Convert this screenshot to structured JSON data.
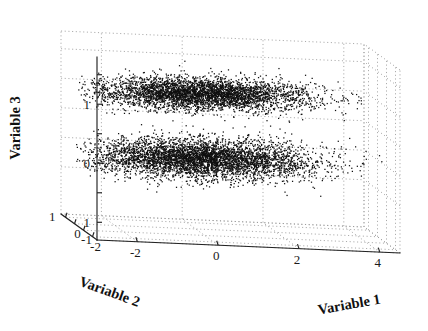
{
  "chart_data": {
    "type": "scatter",
    "dimensions": "3d",
    "title": "",
    "xlabel": "Variable 1",
    "ylabel": "Variable 2",
    "zlabel": "Variable 3",
    "xticks": [
      "-2",
      "0",
      "2",
      "4"
    ],
    "xtick_values": [
      -2,
      0,
      2,
      4
    ],
    "yticks": [
      "1",
      "0",
      "-1",
      "-2"
    ],
    "ytick_values": [
      1,
      0,
      -1,
      -2
    ],
    "zticks": [
      "1",
      "0",
      "1"
    ],
    "ztick_values": [
      1,
      0,
      -1
    ],
    "xlim": [
      -3,
      4.5
    ],
    "ylim": [
      -2.5,
      1.5
    ],
    "zlim": [
      -1.3,
      1.8
    ],
    "grid": true,
    "grid_style": "dotted",
    "legend": null,
    "point_color": "#101010",
    "point_size": 1,
    "background": "#ffffff",
    "axis_color": "#222222",
    "gridline_color": "#9a9a9a",
    "series": [
      {
        "name": "cluster-upper",
        "n_points": 4000,
        "center": [
          0.0,
          -0.55,
          1.05
        ],
        "spread": [
          1.35,
          0.42,
          0.13
        ],
        "description": "dense elongated cloud at Variable 3 near 1"
      },
      {
        "name": "cluster-lower",
        "n_points": 4600,
        "center": [
          0.0,
          -0.55,
          -0.05
        ],
        "spread": [
          1.4,
          0.5,
          0.16
        ],
        "description": "dense elongated cloud at Variable 3 near 0"
      }
    ]
  },
  "axes": {
    "x_title": "Variable 1",
    "y_title": "Variable 2",
    "z_title": "Variable 3"
  }
}
